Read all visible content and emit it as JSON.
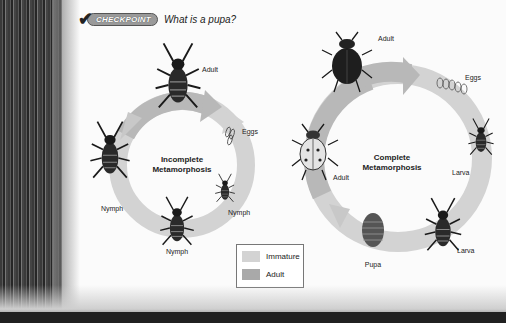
{
  "checkpoint": {
    "badge": "CHECKPOINT",
    "question": "What is a pupa?"
  },
  "colors": {
    "immature": "#d3d3d3",
    "adult": "#a9a9a9",
    "page": "#fbfbfb"
  },
  "incomplete_cycle": {
    "title_line1": "Incomplete",
    "title_line2": "Metamorphosis",
    "stages": [
      {
        "label": "Adult",
        "kind": "adult"
      },
      {
        "label": "Eggs",
        "kind": "immature"
      },
      {
        "label": "Nymph",
        "kind": "immature"
      },
      {
        "label": "Nymph",
        "kind": "immature"
      },
      {
        "label": "Nymph",
        "kind": "immature"
      }
    ]
  },
  "complete_cycle": {
    "title_line1": "Complete",
    "title_line2": "Metamorphosis",
    "stages": [
      {
        "label": "Adult",
        "kind": "adult"
      },
      {
        "label": "Eggs",
        "kind": "immature"
      },
      {
        "label": "Larva",
        "kind": "immature"
      },
      {
        "label": "Larva",
        "kind": "immature"
      },
      {
        "label": "Pupa",
        "kind": "immature"
      },
      {
        "label": "Adult",
        "kind": "adult"
      }
    ]
  },
  "legend": {
    "items": [
      {
        "label": "Immature",
        "color": "#d3d3d3"
      },
      {
        "label": "Adult",
        "color": "#a9a9a9"
      }
    ]
  }
}
